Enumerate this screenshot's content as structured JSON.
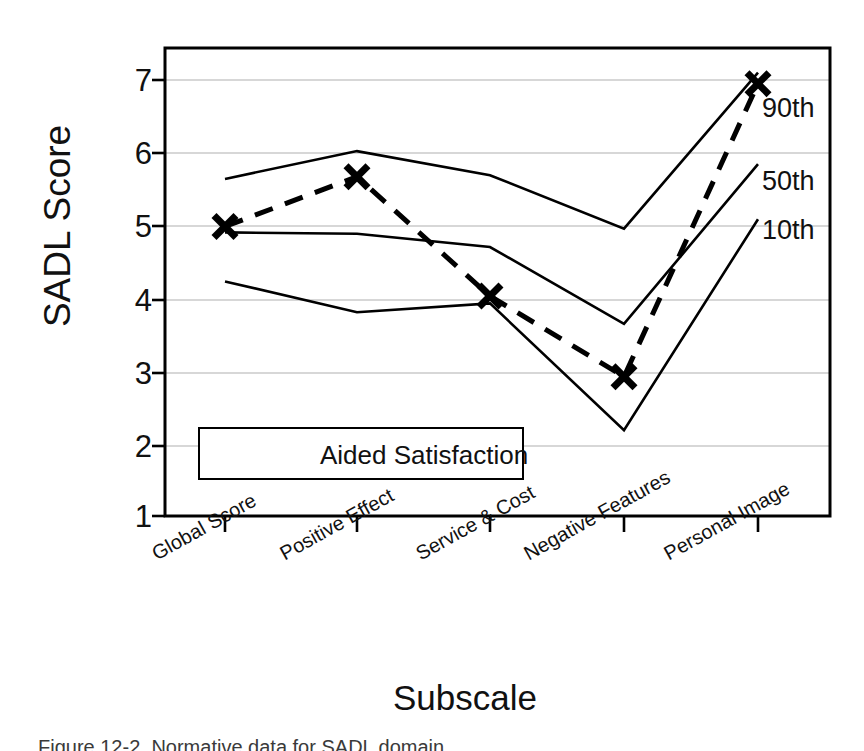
{
  "chart_data": {
    "type": "line",
    "title": "",
    "xlabel": "Subscale",
    "ylabel": "SADL Score",
    "categories": [
      "Global Score",
      "Positive Effect",
      "Service & Cost",
      "Negative Features",
      "Personal Image"
    ],
    "ylim": [
      1,
      7.5
    ],
    "yticks": [
      1,
      2,
      3,
      4,
      5,
      6,
      7
    ],
    "ytick_labels": [
      "1",
      "2",
      "3",
      "4",
      "5",
      "6",
      "7"
    ],
    "grid": "horizontal",
    "legend_position": "inside-lower-left",
    "series": [
      {
        "name": "Aided Satisfaction",
        "style": "dashed",
        "marker": "x",
        "values": [
          5.0,
          5.68,
          4.05,
          2.95,
          6.95
        ]
      },
      {
        "name": "90th",
        "style": "solid",
        "marker": "none",
        "values": [
          5.65,
          6.03,
          5.7,
          4.97,
          7.1
        ]
      },
      {
        "name": "50th",
        "style": "solid",
        "marker": "none",
        "values": [
          4.92,
          4.9,
          4.72,
          3.67,
          5.85
        ]
      },
      {
        "name": "10th",
        "style": "solid",
        "marker": "none",
        "values": [
          4.25,
          3.83,
          3.95,
          2.22,
          5.1
        ]
      }
    ],
    "annotations": [
      {
        "text": "90th",
        "x": 5,
        "y": 6.75
      },
      {
        "text": "50th",
        "x": 5,
        "y": 5.65
      },
      {
        "text": "10th",
        "x": 5,
        "y": 4.95
      }
    ]
  },
  "legend": {
    "entries": [
      {
        "label": "Aided Satisfaction",
        "marker": "x-marker",
        "line": "dashed"
      }
    ]
  },
  "caption": {
    "text": "Figure 12-2.  Normative data for SADL domain"
  },
  "colors": {
    "ink": "#000000",
    "grid": "#aaaaaa",
    "background": "#ffffff"
  }
}
